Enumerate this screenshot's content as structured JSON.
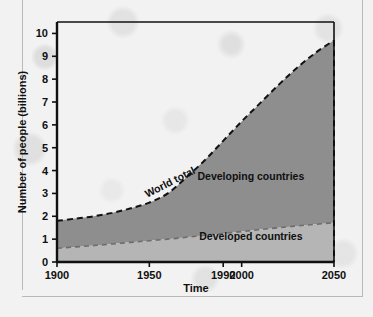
{
  "chart_data": {
    "type": "area",
    "title": "",
    "xlabel": "Time",
    "ylabel": "Number of people (billions)",
    "xlim": [
      1900,
      2050
    ],
    "ylim": [
      0,
      10.5
    ],
    "grid": false,
    "legend_position": "inside-plot",
    "x_ticks": [
      {
        "value": 1900,
        "label": "1900"
      },
      {
        "value": 1950,
        "label": "1950"
      },
      {
        "value": 1990,
        "label": "1990"
      },
      {
        "value": 2000,
        "label": "2000"
      },
      {
        "value": 2050,
        "label": "2050"
      }
    ],
    "y_ticks": [
      {
        "value": 0,
        "label": "0"
      },
      {
        "value": 1,
        "label": "1"
      },
      {
        "value": 2,
        "label": "2"
      },
      {
        "value": 3,
        "label": "3"
      },
      {
        "value": 4,
        "label": "4"
      },
      {
        "value": 5,
        "label": "5"
      },
      {
        "value": 6,
        "label": "6"
      },
      {
        "value": 7,
        "label": "7"
      },
      {
        "value": 8,
        "label": "8"
      },
      {
        "value": 9,
        "label": "9"
      },
      {
        "value": 10,
        "label": "10"
      }
    ],
    "x": [
      1900,
      1910,
      1920,
      1930,
      1940,
      1950,
      1960,
      1970,
      1980,
      1990,
      2000,
      2010,
      2020,
      2030,
      2040,
      2050
    ],
    "series": [
      {
        "name": "World total",
        "label": "World total",
        "style": "dashed",
        "color": "#111111",
        "values": [
          1.8,
          1.9,
          2.0,
          2.15,
          2.35,
          2.6,
          3.0,
          3.7,
          4.45,
          5.3,
          6.15,
          6.95,
          7.75,
          8.5,
          9.15,
          9.7
        ]
      },
      {
        "name": "Developed countries",
        "label": "Developed countries",
        "style": "dashed",
        "color": "#6d6d6d",
        "values": [
          0.6,
          0.66,
          0.72,
          0.79,
          0.86,
          0.93,
          1.0,
          1.08,
          1.17,
          1.25,
          1.33,
          1.42,
          1.5,
          1.58,
          1.65,
          1.72
        ]
      }
    ],
    "bands": [
      {
        "name": "Developing countries",
        "label": "Developing countries",
        "fill_color": "#8e8e8e",
        "between": [
          "Developed countries",
          "World total"
        ]
      },
      {
        "name": "Developed countries",
        "label": "Developed countries",
        "fill_color": "#b5b5b5",
        "between": [
          "baseline",
          "Developed countries"
        ]
      }
    ],
    "annotations": [
      {
        "text": "World total",
        "x": 1962,
        "y": 3.35,
        "rotation": -27
      },
      {
        "text": "Developing countries",
        "x": 2005,
        "y": 3.6,
        "rotation": 0
      },
      {
        "text": "Developed countries",
        "x": 2005,
        "y": 0.95,
        "rotation": 0
      }
    ]
  },
  "colors": {
    "frame": "#101010",
    "developing_fill": "#8e8e8e",
    "developed_fill": "#b5b5b5",
    "page_background": "#f2f2f2",
    "rule": "#b9b9b9"
  }
}
